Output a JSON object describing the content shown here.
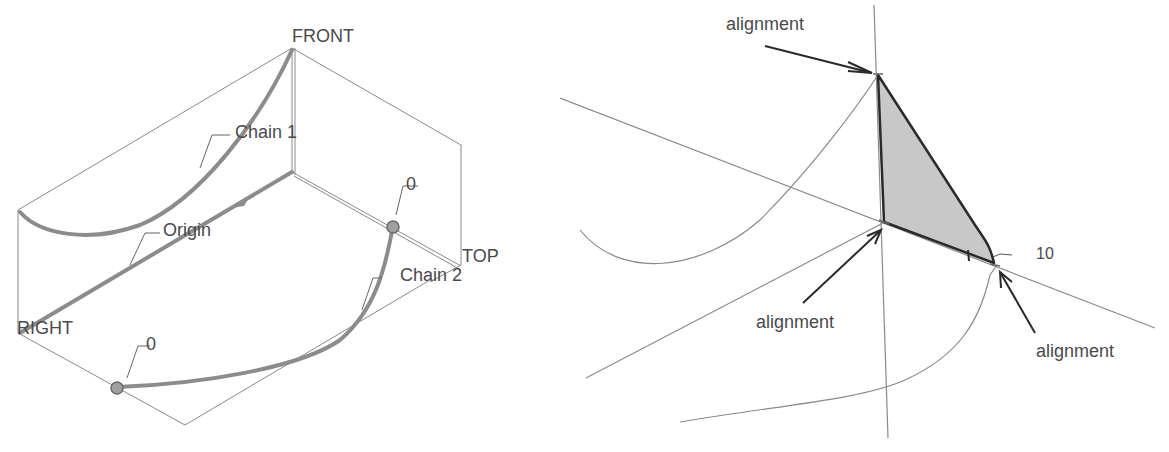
{
  "left_panel": {
    "plane_labels": {
      "front": "FRONT",
      "top": "TOP",
      "right": "RIGHT"
    },
    "callouts": {
      "chain1": "Chain 1",
      "chain2": "Chain 2",
      "origin": "Origin",
      "point_upper": "0",
      "point_lower": "0"
    }
  },
  "right_panel": {
    "callouts": {
      "alignment_top": "alignment",
      "alignment_middle": "alignment",
      "alignment_right": "alignment",
      "dimension_value": "10"
    }
  },
  "colors": {
    "thin_line": "#8a8a8a",
    "thick_curve": "#8c8c8c",
    "dark_edge": "#2a2a2a",
    "fill_surface": "#c8c8c8",
    "point_fill": "#a0a0a0",
    "text": "#4a4a4a"
  }
}
